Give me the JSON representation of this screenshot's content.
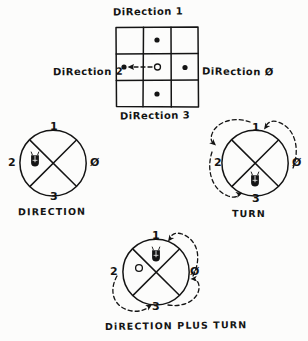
{
  "figure": {
    "kind": "hand-drawn-diagram",
    "background_color": "#fcfcfb",
    "ink_color": "#141414"
  },
  "grid_panel": {
    "title": "DiRection 1",
    "label_left": "DiRection 2",
    "label_right": "DiRection Ø",
    "label_bottom": "DiRection 3",
    "rows": 3,
    "cols": 3,
    "cells": [
      {
        "row": 0,
        "col": 0,
        "marker": "none"
      },
      {
        "row": 0,
        "col": 1,
        "marker": "filled-dot"
      },
      {
        "row": 0,
        "col": 2,
        "marker": "none"
      },
      {
        "row": 1,
        "col": 0,
        "marker": "filled-dot"
      },
      {
        "row": 1,
        "col": 1,
        "marker": "open-dot"
      },
      {
        "row": 1,
        "col": 2,
        "marker": "filled-dot"
      },
      {
        "row": 2,
        "col": 0,
        "marker": "none"
      },
      {
        "row": 2,
        "col": 1,
        "marker": "filled-dot"
      },
      {
        "row": 2,
        "col": 2,
        "marker": "none"
      }
    ],
    "motion_arrow": {
      "style": "dashed",
      "direction": "left",
      "from": "center",
      "to": "middle-left"
    }
  },
  "circles": [
    {
      "id": "direction",
      "caption": "DIRECTION",
      "labels": {
        "top": "1",
        "left": "2",
        "right": "Ø",
        "bottom": "3"
      },
      "markers": [
        {
          "quadrant": "left",
          "type": "bug"
        }
      ],
      "arcs": []
    },
    {
      "id": "turn",
      "caption": "TURN",
      "labels": {
        "top": "1",
        "left": "2",
        "right": "Ø",
        "bottom": "3"
      },
      "markers": [
        {
          "quadrant": "bottom",
          "type": "bug"
        }
      ],
      "arcs": [
        {
          "style": "dashed",
          "from": "Ø",
          "to": "1",
          "arrowhead": true
        },
        {
          "style": "dashed",
          "from": "1",
          "to": "2",
          "arrowhead": true
        },
        {
          "style": "dashed",
          "from": "2",
          "to": "3",
          "arrowhead": true
        }
      ]
    },
    {
      "id": "direction-plus-turn",
      "caption": "DiRECTION PLUS TURN",
      "labels": {
        "top": "1",
        "left": "2",
        "right": "Ø",
        "bottom": "3"
      },
      "markers": [
        {
          "quadrant": "top",
          "type": "bug"
        },
        {
          "quadrant": "left",
          "type": "open-dot"
        }
      ],
      "arcs": [
        {
          "style": "dashed",
          "from": "Ø",
          "to": "1",
          "arrowhead": true
        },
        {
          "style": "dashed",
          "from": "3",
          "to": "Ø",
          "arrowhead": true
        },
        {
          "style": "dashed",
          "from": "2",
          "to": "3",
          "arrowhead": true
        }
      ]
    }
  ]
}
